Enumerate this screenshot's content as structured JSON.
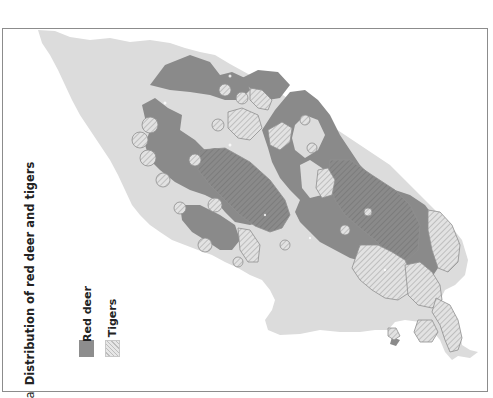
{
  "figure": {
    "panel_letter": "a",
    "title": "Distribution of red deer and tigers"
  },
  "legend": {
    "items": [
      {
        "label": "Red deer",
        "style": "solid",
        "color": "#8d8d8d"
      },
      {
        "label": "Tigers",
        "style": "hatched",
        "color": "#bdbdbd"
      }
    ]
  },
  "map": {
    "land_color": "#dcdcdc",
    "red_deer_color": "#8a8a8a",
    "tiger_hatch_color": "#9a9a9a",
    "frame_color": "#8c8c8c",
    "orientation": "rotated 90° counter-clockwise"
  }
}
